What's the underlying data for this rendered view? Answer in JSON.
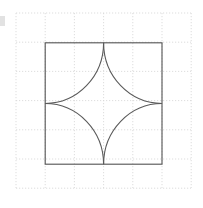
{
  "figure": {
    "background_color": "#ffffff",
    "stroke_color": "#5a5a5a",
    "grid_color": "#d9d9d9"
  },
  "canvas": {
    "width": 203,
    "height": 208
  },
  "grid": {
    "style": "dotted",
    "origin_x": 16,
    "origin_y": 13,
    "spacing": 29.2,
    "columns": 7,
    "rows": 7,
    "extent_x_end": 191,
    "extent_y_end": 188,
    "vertical_lines": [
      16,
      45.2,
      74.4,
      103.6,
      132.8,
      162.0,
      191.2
    ],
    "horizontal_lines": [
      13,
      42.2,
      71.4,
      100.6,
      129.8,
      159.0,
      188.2
    ]
  },
  "square": {
    "label": "square",
    "left": 45.2,
    "top": 42.8,
    "right": 162.0,
    "bottom": 164.2,
    "width": 116.8,
    "height": 121.4,
    "corners": [
      {
        "name": "top-left",
        "x": 45.2,
        "y": 42.8
      },
      {
        "name": "top-right",
        "x": 162.0,
        "y": 42.8
      },
      {
        "name": "bottom-right",
        "x": 162.0,
        "y": 164.2
      },
      {
        "name": "bottom-left",
        "x": 45.2,
        "y": 164.2
      }
    ]
  },
  "astroid": {
    "label": "four-cusped star",
    "center": {
      "x": 103.6,
      "y": 103.5
    },
    "cusps": [
      {
        "name": "top-cusp",
        "x": 103.6,
        "y": 42.8
      },
      {
        "name": "right-cusp",
        "x": 162.0,
        "y": 103.5
      },
      {
        "name": "bottom-cusp",
        "x": 103.6,
        "y": 164.2
      },
      {
        "name": "left-cusp",
        "x": 45.2,
        "y": 103.5
      }
    ],
    "arcs": [
      {
        "name": "arc-top-left",
        "center_corner": "top-left",
        "cx": 45.2,
        "cy": 42.8,
        "rx": 58.4,
        "ry": 60.7,
        "from": {
          "x": 103.6,
          "y": 42.8
        },
        "to": {
          "x": 45.2,
          "y": 103.5
        }
      },
      {
        "name": "arc-top-right",
        "center_corner": "top-right",
        "cx": 162.0,
        "cy": 42.8,
        "rx": 58.4,
        "ry": 60.7,
        "from": {
          "x": 162.0,
          "y": 103.5
        },
        "to": {
          "x": 103.6,
          "y": 42.8
        }
      },
      {
        "name": "arc-bottom-right",
        "center_corner": "bottom-right",
        "cx": 162.0,
        "cy": 164.2,
        "rx": 58.4,
        "ry": 60.7,
        "from": {
          "x": 103.6,
          "y": 164.2
        },
        "to": {
          "x": 162.0,
          "y": 103.5
        }
      },
      {
        "name": "arc-bottom-left",
        "center_corner": "bottom-left",
        "cx": 45.2,
        "cy": 164.2,
        "rx": 58.4,
        "ry": 60.7,
        "from": {
          "x": 45.2,
          "y": 103.5
        },
        "to": {
          "x": 103.6,
          "y": 164.2
        }
      }
    ]
  },
  "artifacts": {
    "left_edge_smudge": {
      "x": 0,
      "y": 16,
      "width": 5,
      "height": 10
    }
  }
}
